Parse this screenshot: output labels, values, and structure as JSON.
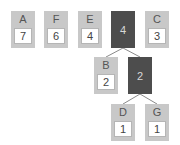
{
  "diagram": {
    "type": "huffman-tree",
    "colors": {
      "leaf": "#c8c8c8",
      "internal": "#4d4d4d",
      "edge": "#8a8a8a"
    },
    "top_row": [
      {
        "id": "A",
        "symbol": "A",
        "weight": "7",
        "kind": "leaf"
      },
      {
        "id": "F",
        "symbol": "F",
        "weight": "6",
        "kind": "leaf"
      },
      {
        "id": "E",
        "symbol": "E",
        "weight": "4",
        "kind": "leaf"
      },
      {
        "id": "n4",
        "symbol": "",
        "weight": "4",
        "kind": "internal"
      },
      {
        "id": "C",
        "symbol": "C",
        "weight": "3",
        "kind": "leaf"
      }
    ],
    "level2": [
      {
        "id": "B",
        "symbol": "B",
        "weight": "2",
        "kind": "leaf"
      },
      {
        "id": "n2",
        "symbol": "",
        "weight": "2",
        "kind": "internal"
      }
    ],
    "level3": [
      {
        "id": "D",
        "symbol": "D",
        "weight": "1",
        "kind": "leaf"
      },
      {
        "id": "G",
        "symbol": "G",
        "weight": "1",
        "kind": "leaf"
      }
    ],
    "edges": [
      [
        "n4",
        "B"
      ],
      [
        "n4",
        "n2"
      ],
      [
        "n2",
        "D"
      ],
      [
        "n2",
        "G"
      ]
    ]
  }
}
